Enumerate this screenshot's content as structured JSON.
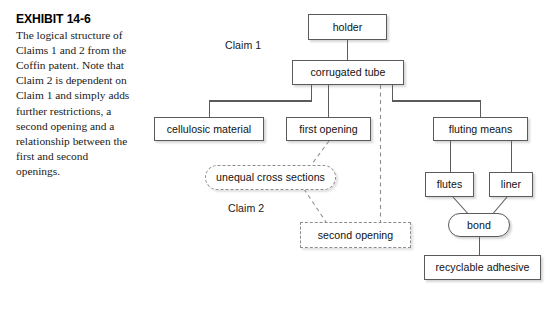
{
  "caption": {
    "exhibit_label": "EXHIBIT 14-6",
    "text": "The logical structure of Claims 1 and 2 from the Coffin patent. Note that Claim 2 is dependent on Claim 1 and simply adds further restrictions, a second opening and a relationship between the first and second openings."
  },
  "diagram": {
    "group_labels": [
      {
        "text": "Claim 1",
        "x": 225,
        "y": 39
      },
      {
        "text": "Claim 2",
        "x": 228,
        "y": 202
      }
    ],
    "nodes": [
      {
        "id": "holder",
        "label": "holder",
        "shape": "solid-box",
        "x": 308,
        "y": 14,
        "w": 79,
        "h": 26
      },
      {
        "id": "corrugated-tube",
        "label": "corrugated tube",
        "shape": "solid-box",
        "x": 292,
        "y": 60,
        "w": 112,
        "h": 25
      },
      {
        "id": "cellulosic-material",
        "label": "cellulosic material",
        "shape": "solid-box",
        "x": 154,
        "y": 117,
        "w": 110,
        "h": 24
      },
      {
        "id": "first-opening",
        "label": "first opening",
        "shape": "solid-box",
        "x": 286,
        "y": 117,
        "w": 85,
        "h": 24
      },
      {
        "id": "fluting-means",
        "label": "fluting means",
        "shape": "solid-box",
        "x": 433,
        "y": 117,
        "w": 95,
        "h": 24
      },
      {
        "id": "flutes",
        "label": "flutes",
        "shape": "solid-box",
        "x": 425,
        "y": 172,
        "w": 49,
        "h": 25
      },
      {
        "id": "liner",
        "label": "liner",
        "shape": "solid-box",
        "x": 489,
        "y": 172,
        "w": 44,
        "h": 25
      },
      {
        "id": "bond",
        "label": "bond",
        "shape": "stadium",
        "x": 448,
        "y": 213,
        "w": 62,
        "h": 24
      },
      {
        "id": "recyclable-adhesive",
        "label": "recyclable adhesive",
        "shape": "solid-box",
        "x": 424,
        "y": 255,
        "w": 117,
        "h": 25
      },
      {
        "id": "unequal-cross-sections",
        "label": "unequal cross sections",
        "shape": "dashed-stadium",
        "x": 205,
        "y": 165,
        "w": 131,
        "h": 25
      },
      {
        "id": "second-opening",
        "label": "second opening",
        "shape": "dashed-box",
        "x": 300,
        "y": 222,
        "w": 111,
        "h": 26
      }
    ],
    "colors": {
      "solid_stroke": "#5b5b5b",
      "dashed_stroke": "#8d8d8d",
      "node_fill": "#ffffff",
      "text": "#111111"
    },
    "edges": [
      {
        "from": "holder",
        "to": "corrugated-tube",
        "style": "solid",
        "routing": "vertical"
      },
      {
        "from": "corrugated-tube",
        "to": "cellulosic-material",
        "style": "solid",
        "routing": "orthogonal"
      },
      {
        "from": "corrugated-tube",
        "to": "first-opening",
        "style": "solid",
        "routing": "vertical"
      },
      {
        "from": "corrugated-tube",
        "to": "fluting-means",
        "style": "solid",
        "routing": "orthogonal"
      },
      {
        "from": "corrugated-tube",
        "to": "second-opening",
        "style": "dashed",
        "routing": "vertical"
      },
      {
        "from": "fluting-means",
        "to": "flutes",
        "style": "solid",
        "routing": "orthogonal"
      },
      {
        "from": "fluting-means",
        "to": "liner",
        "style": "solid",
        "routing": "orthogonal"
      },
      {
        "from": "flutes",
        "to": "bond",
        "style": "solid",
        "routing": "diagonal"
      },
      {
        "from": "liner",
        "to": "bond",
        "style": "solid",
        "routing": "diagonal"
      },
      {
        "from": "bond",
        "to": "recyclable-adhesive",
        "style": "solid",
        "routing": "vertical"
      },
      {
        "from": "first-opening",
        "to": "unequal-cross-sections",
        "style": "dashed",
        "routing": "diagonal"
      },
      {
        "from": "unequal-cross-sections",
        "to": "second-opening",
        "style": "dashed",
        "routing": "diagonal"
      }
    ]
  }
}
